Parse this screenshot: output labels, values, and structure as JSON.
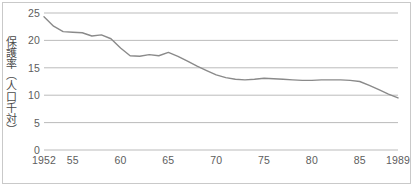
{
  "figure": {
    "background_color": "#ffffff",
    "frame_color": "#c9c9c9",
    "gridline_color": "#b3b3b3",
    "line_color": "#8a8a8a",
    "tick_text_color": "#5d5d5d",
    "axis_title_color": "#4a4a4a"
  },
  "axis_titles": {
    "y_vertical": "保護率（人口千対）"
  },
  "y_ticks": [
    {
      "label": "25",
      "value": 25
    },
    {
      "label": "20",
      "value": 20
    },
    {
      "label": "15",
      "value": 15
    },
    {
      "label": "10",
      "value": 10
    },
    {
      "label": "5",
      "value": 5
    },
    {
      "label": "0",
      "value": 0
    }
  ],
  "x_ticks": [
    {
      "label": "1952",
      "year": 1952
    },
    {
      "label": "55",
      "year": 1955
    },
    {
      "label": "60",
      "year": 1960
    },
    {
      "label": "65",
      "year": 1965
    },
    {
      "label": "70",
      "year": 1970
    },
    {
      "label": "75",
      "year": 1975
    },
    {
      "label": "80",
      "year": 1980
    },
    {
      "label": "85",
      "year": 1985
    },
    {
      "label": "1989",
      "year": 1989
    }
  ],
  "chart_data": {
    "type": "line",
    "title": "",
    "subtitle": "",
    "xlabel": "",
    "ylabel": "保護率（人口千対）",
    "xlim": [
      1952,
      1989
    ],
    "ylim": [
      0,
      25
    ],
    "yticks": [
      0,
      5,
      10,
      15,
      20,
      25
    ],
    "xticks": [
      1952,
      1955,
      1960,
      1965,
      1970,
      1975,
      1980,
      1985,
      1989
    ],
    "xtick_labels": [
      "1952",
      "55",
      "60",
      "65",
      "70",
      "75",
      "80",
      "85",
      "1989"
    ],
    "grid": "horizontal",
    "legend": null,
    "series": [
      {
        "name": "保護率（人口千対）",
        "color": "#8a8a8a",
        "x": [
          1952,
          1953,
          1954,
          1955,
          1956,
          1957,
          1958,
          1959,
          1960,
          1961,
          1962,
          1963,
          1964,
          1965,
          1966,
          1967,
          1968,
          1969,
          1970,
          1971,
          1972,
          1973,
          1974,
          1975,
          1976,
          1977,
          1978,
          1979,
          1980,
          1981,
          1982,
          1983,
          1984,
          1985,
          1986,
          1987,
          1988,
          1989
        ],
        "values": [
          24.3,
          22.6,
          21.6,
          21.5,
          21.4,
          20.8,
          21.0,
          20.3,
          18.6,
          17.2,
          17.1,
          17.4,
          17.2,
          17.8,
          17.1,
          16.2,
          15.3,
          14.5,
          13.7,
          13.2,
          12.9,
          12.8,
          12.9,
          13.1,
          13.0,
          12.9,
          12.8,
          12.7,
          12.7,
          12.8,
          12.8,
          12.8,
          12.7,
          12.5,
          11.8,
          11.0,
          10.2,
          9.5
        ]
      }
    ]
  }
}
